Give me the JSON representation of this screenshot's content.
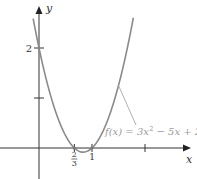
{
  "chart_data": {
    "type": "line",
    "title": "",
    "function": "3x^2 - 5x + 2",
    "series": [
      {
        "name": "f(x) = 3x² − 5x + 2",
        "x": [
          -0.11,
          0,
          0.2,
          0.4,
          0.6,
          0.6667,
          0.8333,
          1,
          1.2,
          1.4,
          1.6,
          1.78
        ],
        "y": [
          2.6,
          2,
          1.12,
          0.48,
          0.08,
          0,
          -0.0833,
          0,
          0.32,
          0.88,
          1.68,
          2.6
        ]
      }
    ],
    "xlabel": "x",
    "ylabel": "y",
    "xlim": [
      -0.75,
      2.8
    ],
    "ylim": [
      -0.7,
      2.95
    ],
    "x_ticks": [
      {
        "value": 0.6667,
        "label_num": "2",
        "label_den": "3"
      },
      {
        "value": 1,
        "label": "1"
      },
      {
        "value": 2,
        "label": ""
      }
    ],
    "y_ticks": [
      {
        "value": 1,
        "label": ""
      },
      {
        "value": 2,
        "label": "2"
      }
    ],
    "annotation": {
      "text_prefix": "f(x) = 3x",
      "text_sup": "2",
      "text_suffix": " − 5x + 2",
      "points_to_x": 1.5
    },
    "grid": false
  }
}
